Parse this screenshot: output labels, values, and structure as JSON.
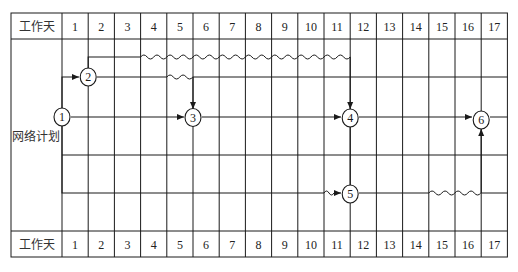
{
  "header": {
    "row_label": "工作天",
    "days": [
      "1",
      "2",
      "3",
      "4",
      "5",
      "6",
      "7",
      "8",
      "9",
      "10",
      "11",
      "12",
      "13",
      "14",
      "15",
      "16",
      "17"
    ]
  },
  "footer": {
    "row_label": "工作天",
    "days": [
      "1",
      "2",
      "3",
      "4",
      "5",
      "6",
      "7",
      "8",
      "9",
      "10",
      "11",
      "12",
      "13",
      "14",
      "15",
      "16",
      "17"
    ]
  },
  "body_label": "网络计划",
  "colors": {
    "line": "#1a1a1a",
    "background": "#ffffff"
  },
  "network": {
    "type": "time-scaled network plan",
    "nodes": [
      {
        "id": "1",
        "label": "1",
        "day": 0
      },
      {
        "id": "2",
        "label": "2",
        "day": 1
      },
      {
        "id": "3",
        "label": "3",
        "day": 5
      },
      {
        "id": "4",
        "label": "4",
        "day": 11
      },
      {
        "id": "5",
        "label": "5",
        "day": 11
      },
      {
        "id": "6",
        "label": "6",
        "day": 16
      }
    ],
    "arrows": [
      {
        "from": "1",
        "to": "2",
        "work_days": 1,
        "free_float_days": 0
      },
      {
        "from": "1",
        "to": "3",
        "work_days": 5,
        "free_float_days": 0
      },
      {
        "from": "1",
        "to": "5",
        "work_days": 10,
        "free_float_days": 1
      },
      {
        "from": "2",
        "to": "3",
        "work_days": 3,
        "free_float_days": 1
      },
      {
        "from": "2",
        "to": "4",
        "work_days": 2,
        "free_float_days": 8
      },
      {
        "from": "3",
        "to": "4",
        "work_days": 6,
        "free_float_days": 0
      },
      {
        "from": "4",
        "to": "5",
        "work_days": 0,
        "free_float_days": 0,
        "dummy": true
      },
      {
        "from": "4",
        "to": "6",
        "work_days": 5,
        "free_float_days": 0
      },
      {
        "from": "5",
        "to": "6",
        "work_days": 3,
        "free_float_days": 2
      }
    ]
  }
}
